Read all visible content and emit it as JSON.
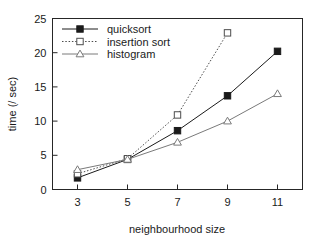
{
  "chart_data": {
    "type": "line",
    "title": "",
    "xlabel": "neighbourhood size",
    "ylabel": "time (/ sec)",
    "x": [
      3,
      5,
      7,
      9,
      11
    ],
    "xticklabels": [
      "3",
      "5",
      "7",
      "9",
      "11"
    ],
    "yticklabels": [
      "0",
      "5",
      "10",
      "15",
      "20",
      "25"
    ],
    "yticks": [
      0,
      5,
      10,
      15,
      20,
      25
    ],
    "xlim": [
      2,
      12
    ],
    "ylim": [
      0,
      25
    ],
    "grid": false,
    "legend_position": "top-left-inside",
    "series": [
      {
        "name": "quicksort",
        "marker": "filled-square",
        "linestyle": "solid",
        "color": "#1a1a1a",
        "x": [
          3,
          5,
          7,
          9,
          11
        ],
        "values": [
          1.7,
          4.4,
          8.6,
          13.7,
          20.2
        ]
      },
      {
        "name": "insertion sort",
        "marker": "open-square",
        "linestyle": "dotted",
        "color": "#4d4d4d",
        "x": [
          3,
          5,
          7,
          9
        ],
        "values": [
          2.3,
          4.5,
          10.9,
          22.9
        ]
      },
      {
        "name": "histogram",
        "marker": "open-triangle",
        "linestyle": "solid",
        "color": "#7a7a7a",
        "x": [
          3,
          5,
          7,
          9,
          11
        ],
        "values": [
          2.9,
          4.4,
          6.9,
          10.0,
          14.0
        ]
      }
    ]
  },
  "legend": {
    "entries": [
      {
        "label": "quicksort"
      },
      {
        "label": "insertion sort"
      },
      {
        "label": "histogram"
      }
    ]
  },
  "axes": {
    "x_label": "neighbourhood size",
    "y_label": "time (/ sec)"
  }
}
